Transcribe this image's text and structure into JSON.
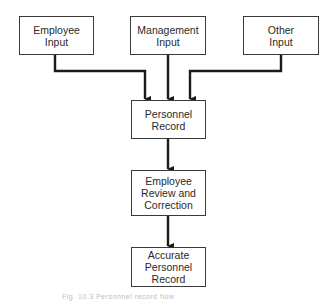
{
  "diagram": {
    "type": "flowchart",
    "nodes": [
      {
        "id": "employee_input",
        "label": "Employee\nInput"
      },
      {
        "id": "management_input",
        "label": "Management\nInput"
      },
      {
        "id": "other_input",
        "label": "Other\nInput"
      },
      {
        "id": "personnel_record",
        "label": "Personnel\nRecord"
      },
      {
        "id": "review",
        "label": "Employee\nReview and\nCorrection"
      },
      {
        "id": "accurate_record",
        "label": "Accurate\nPersonnel\nRecord"
      }
    ],
    "edges": [
      {
        "from": "employee_input",
        "to": "personnel_record"
      },
      {
        "from": "management_input",
        "to": "personnel_record"
      },
      {
        "from": "other_input",
        "to": "personnel_record"
      },
      {
        "from": "personnel_record",
        "to": "review"
      },
      {
        "from": "review",
        "to": "accurate_record"
      }
    ],
    "colors": {
      "line": "#1a1a1a",
      "border": "#3a3a3a",
      "background": "#ffffff"
    }
  },
  "caption": "Fig. 10.3  Personnel record flow"
}
